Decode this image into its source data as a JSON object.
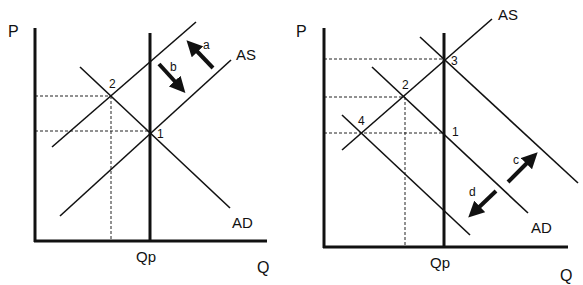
{
  "panels": [
    {
      "id": "left",
      "axis_y_label": "P",
      "axis_x_label": "Q",
      "potential_output_label": "Qp",
      "curve_labels": {
        "as": "AS",
        "ad": "AD"
      },
      "points": [
        "1",
        "2"
      ],
      "arrows": [
        {
          "label": "a",
          "direction": "up-left"
        },
        {
          "label": "b",
          "direction": "down-right"
        }
      ]
    },
    {
      "id": "right",
      "axis_y_label": "P",
      "axis_x_label": "Q",
      "potential_output_label": "Qp",
      "curve_labels": {
        "as": "AS",
        "ad": "AD"
      },
      "points": [
        "1",
        "2",
        "3",
        "4"
      ],
      "arrows": [
        {
          "label": "c",
          "direction": "up-right"
        },
        {
          "label": "d",
          "direction": "down-left"
        }
      ]
    }
  ],
  "colors": {
    "line": "#111111",
    "background": "#ffffff"
  }
}
